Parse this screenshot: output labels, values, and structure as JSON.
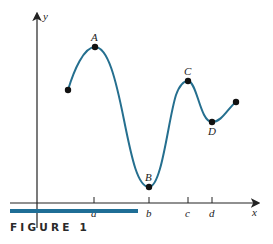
{
  "figure": {
    "caption": "FIGURE 1",
    "accent_color": "#1f6e96",
    "curve_color": "#256f8f",
    "axes": {
      "x_label": "x",
      "y_label": "y"
    },
    "ticks": [
      "a",
      "b",
      "c",
      "d"
    ],
    "points": [
      {
        "label": "",
        "role": "start-endpoint"
      },
      {
        "label": "A",
        "role": "local-maximum",
        "x_tick": "a"
      },
      {
        "label": "B",
        "role": "local-minimum",
        "x_tick": "b"
      },
      {
        "label": "C",
        "role": "local-maximum",
        "x_tick": "c"
      },
      {
        "label": "D",
        "role": "local-minimum",
        "x_tick": "d"
      },
      {
        "label": "",
        "role": "end-endpoint"
      }
    ]
  }
}
